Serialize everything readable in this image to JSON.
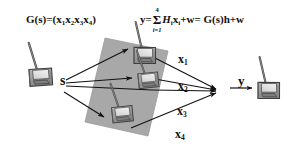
{
  "figure": {
    "background_color": "#ffffff",
    "ink_color": "#111111",
    "region_fill_color": "#a8a8a8",
    "device_body_color": "#8f8f8f",
    "device_outline_color": "#3a3a3a"
  },
  "formulas": {
    "left": {
      "lhs": "G(s)",
      "equals": "=",
      "open_paren": "(",
      "terms": [
        "x",
        "x",
        "x",
        "x"
      ],
      "subscripts": [
        "1",
        "2",
        "3",
        "4"
      ],
      "close_paren": ")",
      "plain": "G(s) = (x1 x2 x3 x4)"
    },
    "right": {
      "lhs": "y",
      "equals": "=",
      "sum_symbol": "Σ",
      "sum_upper": "4",
      "sum_lower": "i=1",
      "summand_coeff": "H",
      "summand_coeff_sub": "i",
      "summand_var": "x",
      "summand_var_sub": "i",
      "plus": "+",
      "noise": "w",
      "equals2": "=",
      "rhs": "G(s)h+w",
      "plain": "y = sum_{i=1}^{4} H_i x_i + w = G(s)h + w"
    }
  },
  "labels": {
    "source": "s",
    "output": "y",
    "paths": [
      {
        "name": "x",
        "subscript": "1"
      },
      {
        "name": "x",
        "subscript": "2"
      },
      {
        "name": "x",
        "subscript": "3"
      },
      {
        "name": "x",
        "subscript": "4"
      }
    ]
  },
  "nodes": {
    "source_device": "handheld-radio-source",
    "relay_devices": [
      "handheld-radio-relay-1",
      "handheld-radio-relay-2",
      "handheld-radio-relay-3"
    ],
    "destination_device": "handheld-radio-destination"
  },
  "edges": {
    "from_source_count": 4,
    "to_destination_count": 4
  }
}
